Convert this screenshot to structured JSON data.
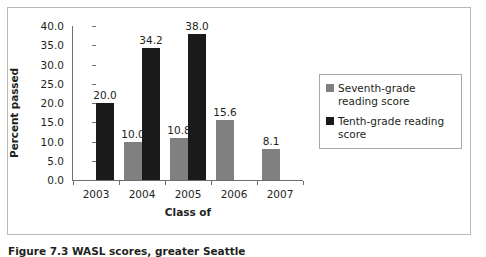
{
  "figure": {
    "caption": "Figure 7.3  WASL scores, greater Seattle"
  },
  "chart_data": {
    "type": "bar",
    "title": "",
    "xlabel": "Class of",
    "ylabel": "Percent passed",
    "categories": [
      "2003",
      "2004",
      "2005",
      "2006",
      "2007"
    ],
    "series": [
      {
        "name": "Seventh-grade reading score",
        "color": "#808080",
        "values": [
          null,
          10.0,
          10.8,
          15.6,
          8.1
        ],
        "labels": [
          "",
          "10.0",
          "10.8",
          "15.6",
          "8.1"
        ]
      },
      {
        "name": "Tenth-grade reading score",
        "color": "#1a1a1a",
        "values": [
          20.0,
          34.2,
          38.0,
          null,
          null
        ],
        "labels": [
          "20.0",
          "34.2",
          "38.0",
          "",
          ""
        ]
      }
    ],
    "ylim": [
      0.0,
      40.0
    ],
    "yticks": [
      "40.0",
      "35.0",
      "30.0",
      "25.0",
      "20.0",
      "15.0",
      "10.0",
      "5.0",
      "0.0"
    ],
    "ytick_values": [
      40.0,
      35.0,
      30.0,
      25.0,
      20.0,
      15.0,
      10.0,
      5.0,
      0.0
    ],
    "grid": false,
    "legend_position": "right"
  },
  "legend": {
    "items": [
      {
        "label": "Seventh-grade reading score",
        "color": "#808080"
      },
      {
        "label": "Tenth-grade reading score",
        "color": "#1a1a1a"
      }
    ]
  }
}
